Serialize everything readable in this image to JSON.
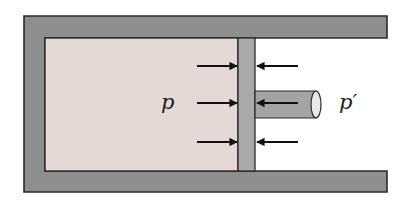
{
  "diagram": {
    "labels": {
      "inside_pressure": "p",
      "outside_pressure": "p′"
    },
    "colors": {
      "wall": "#8e8e8e",
      "wall_stroke": "#2a2a2a",
      "chamber": "#e6d8d4",
      "piston": "#a9a9a9",
      "rod": "#a4a4a4",
      "rod_end": "#e8e8e8",
      "arrow": "#111111",
      "background": "#ffffff"
    },
    "arrows": {
      "left_side": [
        {
          "y": 66,
          "direction": "right"
        },
        {
          "y": 103,
          "direction": "right"
        },
        {
          "y": 142,
          "direction": "right"
        }
      ],
      "right_side": [
        {
          "y": 66,
          "direction": "left"
        },
        {
          "y": 103,
          "direction": "left"
        },
        {
          "y": 142,
          "direction": "left"
        }
      ]
    }
  }
}
